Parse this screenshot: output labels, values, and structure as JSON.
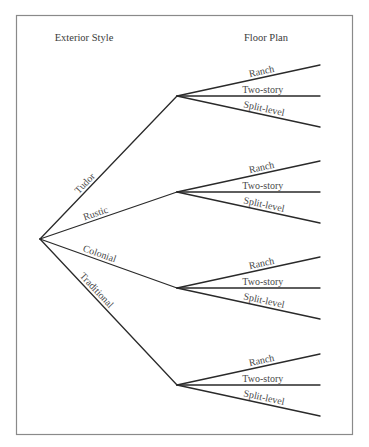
{
  "diagram": {
    "type": "tree-diagram",
    "headers": {
      "level1": "Exterior Style",
      "level2": "Floor Plan"
    },
    "root": "",
    "branches": [
      {
        "label": "Tudor",
        "children": [
          "Ranch",
          "Two-story",
          "Split-level"
        ]
      },
      {
        "label": "Rustic",
        "children": [
          "Ranch",
          "Two-story",
          "Split-level"
        ]
      },
      {
        "label": "Colonial",
        "children": [
          "Ranch",
          "Two-story",
          "Split-level"
        ]
      },
      {
        "label": "Traditional",
        "children": [
          "Ranch",
          "Two-story",
          "Split-level"
        ]
      }
    ],
    "colors": {
      "line": "#2a2a2a",
      "text": "#4a4a4a",
      "frame": "#8a8a8a"
    }
  }
}
